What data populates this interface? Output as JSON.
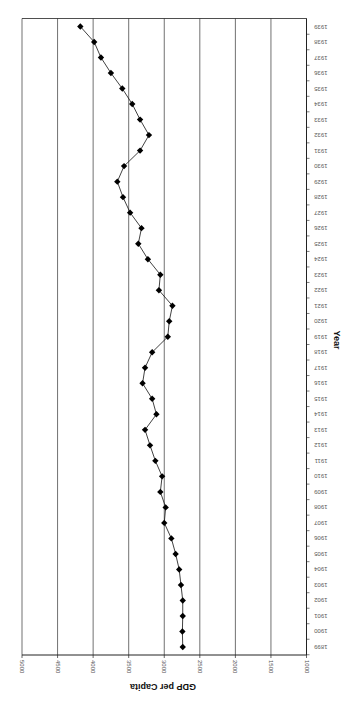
{
  "chart_data": {
    "type": "line",
    "orientation": "rotated-90-clockwise",
    "title": "",
    "xlabel": "Year",
    "ylabel": "GDP per Capita",
    "ylim": [
      1000,
      5000
    ],
    "yticks": [
      1000,
      1500,
      2000,
      2500,
      3000,
      3500,
      4000,
      4500,
      5000
    ],
    "grid": true,
    "legend": "none",
    "marker": "diamond",
    "x": [
      1899,
      1900,
      1901,
      1902,
      1903,
      1904,
      1905,
      1906,
      1907,
      1908,
      1909,
      1910,
      1911,
      1912,
      1913,
      1914,
      1915,
      1916,
      1917,
      1918,
      1919,
      1920,
      1921,
      1922,
      1923,
      1924,
      1925,
      1926,
      1927,
      1928,
      1929,
      1930,
      1931,
      1932,
      1933,
      1934,
      1935,
      1936,
      1937,
      1938,
      1939
    ],
    "series": [
      {
        "name": "GDP per Capita",
        "values": [
          2740,
          2745,
          2740,
          2740,
          2765,
          2790,
          2840,
          2900,
          3000,
          2980,
          3055,
          3030,
          3125,
          3200,
          3270,
          3110,
          3170,
          3305,
          3270,
          3170,
          2950,
          2930,
          2885,
          3075,
          3055,
          3230,
          3365,
          3320,
          3480,
          3580,
          3660,
          3565,
          3340,
          3215,
          3340,
          3450,
          3590,
          3750,
          3890,
          3985,
          4180
        ]
      }
    ],
    "tick_labels": {
      "y": [
        "5000",
        "4500",
        "4000",
        "3500",
        "3000",
        "2500",
        "2000",
        "1500",
        "1000"
      ]
    }
  },
  "axes": {
    "y_title": "GDP per Capita",
    "x_title": "Year"
  },
  "colors": {
    "line": "#111111",
    "marker": "#000000",
    "grid": "#333333",
    "axis": "#222222"
  }
}
